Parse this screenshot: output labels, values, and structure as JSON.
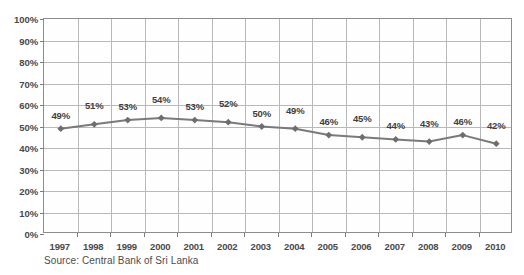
{
  "caption": "Source: Central Bank of Sri Lanka",
  "title_sliver": "",
  "colors": {
    "series": "#7a7a7a",
    "marker": "#6e6e6e",
    "grid": "#b9b9b9",
    "axis": "#8d8d8d",
    "text": "#3f3f41",
    "background": "#ffffff"
  },
  "chart_data": {
    "type": "line",
    "title": "",
    "xlabel": "",
    "ylabel": "",
    "ylim": [
      0,
      100
    ],
    "ytick_step": 10,
    "grid": true,
    "legend": false,
    "marker": "diamond",
    "value_suffix": "%",
    "categories": [
      "1997",
      "1998",
      "1999",
      "2000",
      "2001",
      "2002",
      "2003",
      "2004",
      "2005",
      "2006",
      "2007",
      "2008",
      "2009",
      "2010"
    ],
    "ytick_labels": [
      "0%",
      "10%",
      "20%",
      "30%",
      "40%",
      "50%",
      "60%",
      "70%",
      "80%",
      "90%",
      "100%"
    ],
    "values": [
      49,
      51,
      53,
      54,
      53,
      52,
      50,
      49,
      46,
      45,
      44,
      43,
      46,
      42
    ],
    "data_labels": [
      "49%",
      "51%",
      "53%",
      "54%",
      "53%",
      "52%",
      "50%",
      "49%",
      "46%",
      "45%",
      "44%",
      "43%",
      "46%",
      "42%"
    ]
  }
}
